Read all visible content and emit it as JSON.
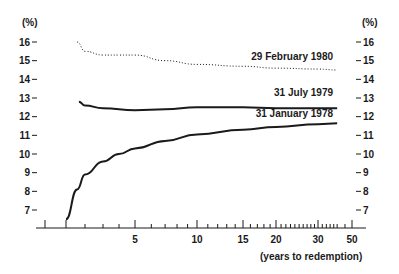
{
  "chart_data": {
    "type": "line",
    "title": "",
    "xlabel": "(years to redemption)",
    "ylabel_left": "(%)",
    "ylabel_right": "(%)",
    "x_scale": "log-like",
    "x_ticks": [
      5,
      10,
      15,
      20,
      30,
      50
    ],
    "y_ticks": [
      7,
      8,
      9,
      10,
      11,
      12,
      13,
      14,
      15,
      16
    ],
    "ylim": [
      6.5,
      16.5
    ],
    "grid": false,
    "series": [
      {
        "name": "29 February 1980",
        "style": "dotted",
        "x": [
          1.5,
          2,
          3,
          4,
          5,
          7,
          10,
          15,
          20,
          30,
          40
        ],
        "values": [
          16.0,
          15.5,
          15.3,
          15.3,
          15.3,
          15.0,
          14.8,
          14.7,
          14.6,
          14.55,
          14.5
        ]
      },
      {
        "name": "31 July 1979",
        "style": "solid",
        "x": [
          1.6,
          2,
          3,
          5,
          7,
          10,
          15,
          20,
          30,
          40
        ],
        "values": [
          12.8,
          12.6,
          12.45,
          12.35,
          12.4,
          12.5,
          12.5,
          12.45,
          12.45,
          12.45
        ]
      },
      {
        "name": "31 January 1978",
        "style": "solid",
        "x": [
          1,
          1.5,
          2,
          3,
          4,
          5,
          7,
          10,
          15,
          20,
          30,
          40
        ],
        "values": [
          6.5,
          8.1,
          8.9,
          9.6,
          10.0,
          10.3,
          10.7,
          11.05,
          11.3,
          11.45,
          11.6,
          11.65
        ]
      }
    ]
  }
}
